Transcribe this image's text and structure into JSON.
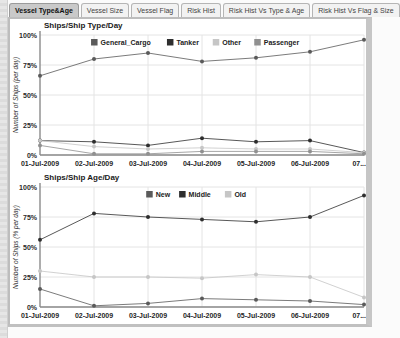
{
  "tabs": {
    "items": [
      {
        "label": "Vessel Type&Age",
        "active": true
      },
      {
        "label": "Vessel Size",
        "active": false
      },
      {
        "label": "Vessel Flag",
        "active": false
      },
      {
        "label": "Risk Hist",
        "active": false
      },
      {
        "label": "Risk Hist Vs Type & Age",
        "active": false
      },
      {
        "label": "Risk Hist Vs Flag & Size",
        "active": false
      }
    ]
  },
  "ui_colors": {
    "active_tab_bg": "#c9c9c9",
    "panel_border": "#c0c0c0",
    "grid": "#e4e4e4",
    "axis": "#8a8a8a"
  },
  "chart_data": [
    {
      "type": "line",
      "title": "Ships/Ship Type/Day",
      "ylabel": "Number of Ships (per day)",
      "xlabel": "",
      "ylim": [
        0,
        100
      ],
      "ytick_step": 25,
      "ytick_suffix": "%",
      "grid": true,
      "legend_position": "top-center",
      "categories": [
        "01-Jul-2009",
        "02-Jul-2009",
        "03-Jul-2009",
        "04-Jul-2009",
        "05-Jul-2009",
        "06-Jul-2009",
        "07..."
      ],
      "series": [
        {
          "name": "General_Cargo",
          "color": "#5a5a5a",
          "values": [
            66,
            80,
            85,
            78,
            81,
            86,
            96
          ]
        },
        {
          "name": "Tanker",
          "color": "#2e2e2e",
          "values": [
            12,
            11,
            8,
            14,
            11,
            12,
            2
          ]
        },
        {
          "name": "Other",
          "color": "#c6c6c6",
          "values": [
            12,
            7,
            5,
            6,
            5,
            5,
            2
          ]
        },
        {
          "name": "Passenger",
          "color": "#909090",
          "values": [
            8,
            1,
            1,
            3,
            3,
            3,
            1
          ]
        }
      ]
    },
    {
      "type": "line",
      "title": "Ships/Ship Age/Day",
      "ylabel": "Number of Ships (% per day)",
      "xlabel": "",
      "ylim": [
        0,
        100
      ],
      "ytick_step": 25,
      "ytick_suffix": "%",
      "grid": true,
      "legend_position": "top-center",
      "categories": [
        "01-Jul-2009",
        "02-Jul-2009",
        "03-Jul-2009",
        "04-Jul-2009",
        "05-Jul-2009",
        "06-Jul-2009",
        "07..."
      ],
      "series": [
        {
          "name": "New",
          "color": "#5a5a5a",
          "values": [
            15,
            1,
            3,
            7,
            6,
            5,
            2
          ]
        },
        {
          "name": "Middle",
          "color": "#2e2e2e",
          "values": [
            56,
            78,
            75,
            73,
            71,
            75,
            93
          ]
        },
        {
          "name": "Old",
          "color": "#c6c6c6",
          "values": [
            30,
            25,
            25,
            24,
            27,
            25,
            8
          ]
        }
      ]
    }
  ]
}
